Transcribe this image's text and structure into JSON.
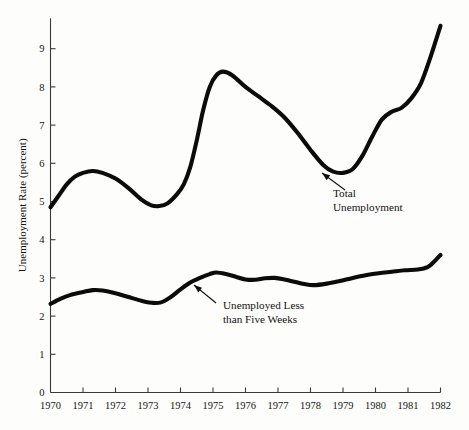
{
  "chart_data": {
    "type": "line",
    "title": "",
    "subtitle": "",
    "xlabel": "",
    "ylabel": "Unemployment Rate (percent)",
    "xlim": [
      1970,
      1982
    ],
    "ylim": [
      0,
      9.8
    ],
    "grid": false,
    "legend_position": "inline-annotations",
    "x_tick_labels": [
      "1970",
      "1971",
      "1972",
      "1973",
      "1974",
      "1975",
      "1976",
      "1977",
      "1978",
      "1979",
      "1980",
      "1981",
      "1982"
    ],
    "x_ticks": [
      1970,
      1971,
      1972,
      1973,
      1974,
      1975,
      1976,
      1977,
      1978,
      1979,
      1980,
      1981,
      1982
    ],
    "y_tick_labels": [
      "0",
      "1",
      "2",
      "3",
      "4",
      "5",
      "6",
      "7",
      "8",
      "9"
    ],
    "y_ticks": [
      0,
      1,
      2,
      3,
      4,
      5,
      6,
      7,
      8,
      9
    ],
    "series": [
      {
        "name": "Total Unemployment",
        "color": "#0b0b0b",
        "x": [
          1970.0,
          1970.25,
          1970.5,
          1970.75,
          1971.0,
          1971.3,
          1971.6,
          1972.0,
          1972.4,
          1972.8,
          1973.1,
          1973.35,
          1973.6,
          1973.9,
          1974.1,
          1974.3,
          1974.5,
          1974.7,
          1974.9,
          1975.1,
          1975.3,
          1975.6,
          1976.0,
          1976.4,
          1976.8,
          1977.2,
          1977.6,
          1978.0,
          1978.4,
          1978.7,
          1979.0,
          1979.3,
          1979.6,
          1979.9,
          1980.2,
          1980.5,
          1980.8,
          1981.1,
          1981.4,
          1981.7,
          1982.0
        ],
        "y": [
          4.85,
          5.15,
          5.45,
          5.65,
          5.75,
          5.8,
          5.75,
          5.6,
          5.35,
          5.05,
          4.9,
          4.88,
          4.95,
          5.2,
          5.45,
          5.9,
          6.6,
          7.4,
          8.0,
          8.3,
          8.4,
          8.3,
          8.0,
          7.75,
          7.5,
          7.2,
          6.8,
          6.35,
          5.95,
          5.78,
          5.75,
          5.85,
          6.2,
          6.7,
          7.15,
          7.35,
          7.45,
          7.7,
          8.1,
          8.8,
          9.6
        ]
      },
      {
        "name": "Unemployed Less than Five Weeks",
        "color": "#0b0b0b",
        "x": [
          1970.0,
          1970.3,
          1970.6,
          1971.0,
          1971.3,
          1971.6,
          1972.0,
          1972.4,
          1972.8,
          1973.1,
          1973.4,
          1973.7,
          1974.0,
          1974.3,
          1974.6,
          1974.9,
          1975.1,
          1975.4,
          1975.7,
          1976.0,
          1976.3,
          1976.6,
          1976.9,
          1977.2,
          1977.5,
          1977.8,
          1978.1,
          1978.5,
          1978.9,
          1979.3,
          1979.7,
          1980.1,
          1980.5,
          1980.9,
          1981.3,
          1981.6,
          1981.8,
          1982.0
        ],
        "y": [
          2.32,
          2.45,
          2.55,
          2.63,
          2.68,
          2.67,
          2.6,
          2.5,
          2.4,
          2.35,
          2.36,
          2.5,
          2.7,
          2.88,
          3.0,
          3.1,
          3.14,
          3.1,
          3.03,
          2.96,
          2.95,
          2.99,
          3.0,
          2.96,
          2.9,
          2.84,
          2.81,
          2.85,
          2.92,
          3.0,
          3.07,
          3.12,
          3.16,
          3.2,
          3.22,
          3.28,
          3.42,
          3.6
        ]
      }
    ],
    "annotations": [
      {
        "name": "total-unemployment",
        "lines": [
          "Total",
          "Unemployment"
        ],
        "text_x": 333,
        "text_y": 197,
        "leader_from_x": 345,
        "leader_from_y": 190,
        "leader_to_x": 322,
        "leader_to_y": 173
      },
      {
        "name": "unemployed-less-than-five-weeks",
        "lines": [
          "Unemployed Less",
          "than Five Weeks"
        ],
        "text_x": 223,
        "text_y": 309,
        "leader_from_x": 216,
        "leader_from_y": 303,
        "leader_to_x": 194,
        "leader_to_y": 285
      }
    ]
  },
  "axes": {
    "y_axis_title": "Unemployment Rate (percent)"
  }
}
